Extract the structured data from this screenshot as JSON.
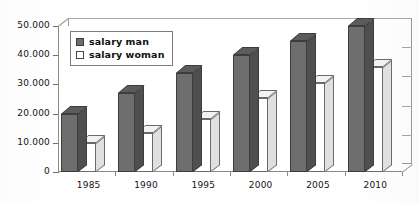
{
  "chart_data": {
    "type": "bar",
    "title": "",
    "subtitle": "",
    "xlabel": "",
    "ylabel": "",
    "categories": [
      "1985",
      "1990",
      "1995",
      "2000",
      "2005",
      "2010"
    ],
    "series": [
      {
        "name": "salary man",
        "color": "#6e6e6e",
        "values": [
          20000,
          27000,
          34000,
          40000,
          45000,
          50000
        ]
      },
      {
        "name": "salary woman",
        "color": "#ffffff",
        "values": [
          10000,
          13500,
          18000,
          25500,
          30500,
          36000
        ]
      }
    ],
    "ylim": [
      0,
      50000
    ],
    "ytick_values": [
      0,
      10000,
      20000,
      30000,
      40000,
      50000
    ],
    "ytick_labels": [
      "0",
      "10.000",
      "20.000",
      "30.000",
      "40.000",
      "50.000"
    ],
    "grid": true,
    "legend_position": "top-left",
    "style": "3d-clustered-column",
    "annotations": []
  },
  "legend": {
    "items": [
      {
        "label": "salary man",
        "swatch": "filled-gray-square"
      },
      {
        "label": "salary woman",
        "swatch": "empty-white-square"
      }
    ]
  },
  "axes": {
    "y": {
      "ticks": [
        {
          "value": 50000,
          "label": "50.000"
        },
        {
          "value": 40000,
          "label": "40.000"
        },
        {
          "value": 30000,
          "label": "30.000"
        },
        {
          "value": 20000,
          "label": "20.000"
        },
        {
          "value": 10000,
          "label": "10.000"
        },
        {
          "value": 0,
          "label": "0"
        }
      ]
    },
    "x": {
      "ticks": [
        {
          "label": "1985"
        },
        {
          "label": "1990"
        },
        {
          "label": "1995"
        },
        {
          "label": "2000"
        },
        {
          "label": "2005"
        },
        {
          "label": "2010"
        }
      ]
    }
  }
}
